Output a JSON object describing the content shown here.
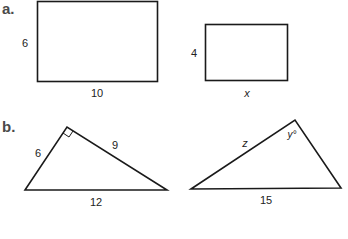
{
  "parts": [
    {
      "label": "a.",
      "figures": [
        {
          "shape": "rectangle",
          "height_label": "6",
          "width_label": "10"
        },
        {
          "shape": "rectangle",
          "height_label": "4",
          "width_label": "x"
        }
      ]
    },
    {
      "label": "b.",
      "figures": [
        {
          "shape": "right-triangle",
          "left_side_label": "6",
          "right_side_label": "9",
          "base_label": "12",
          "right_angle_marker": true
        },
        {
          "shape": "triangle",
          "left_side_label": "z",
          "angle_label": "y°",
          "base_label": "15"
        }
      ]
    }
  ],
  "colors": {
    "stroke": "#1a1a1a",
    "part_label": "#4a4a4a",
    "text": "#222222"
  }
}
